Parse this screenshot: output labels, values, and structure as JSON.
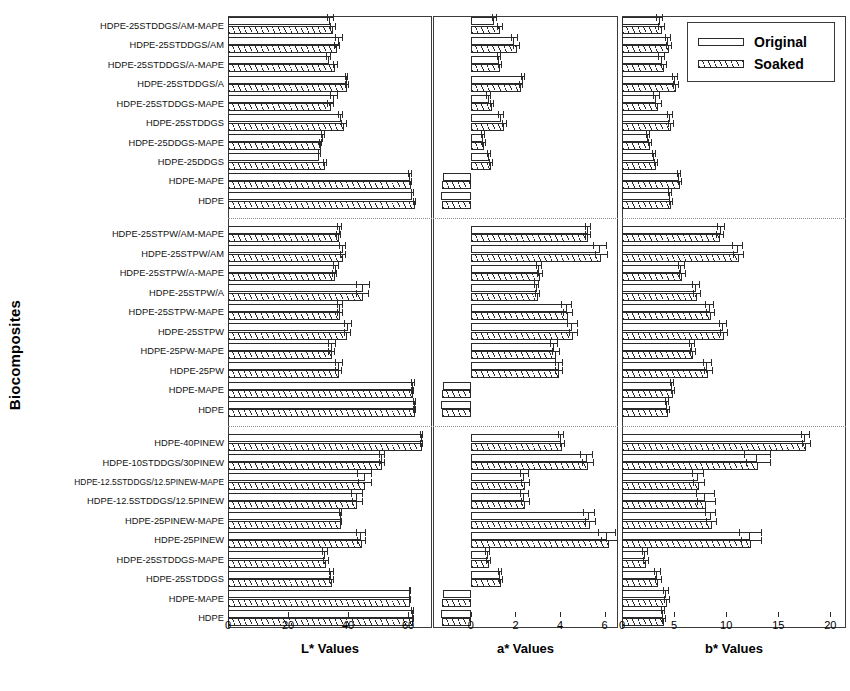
{
  "axis_titles": {
    "y": "Biocomposites",
    "l": "L* Values",
    "a": "a* Values",
    "b": "b* Values"
  },
  "legend": {
    "items": [
      {
        "label": "Original",
        "pattern": "solid-outline"
      },
      {
        "label": "Soaked",
        "pattern": "diagonal-hatch"
      }
    ]
  },
  "colors": {
    "line": "#2a2a2a",
    "frame": "#3b3b3b",
    "divider": "#8e8e8e",
    "fill": "#ffffff"
  },
  "ticks": {
    "l": [
      {
        "v": 0,
        "label": "0"
      },
      {
        "v": 20,
        "label": "20"
      },
      {
        "v": 40,
        "label": "40"
      },
      {
        "v": 60,
        "label": "60"
      }
    ],
    "a": [
      {
        "v": 0,
        "label": "0"
      },
      {
        "v": 2,
        "label": "2"
      },
      {
        "v": 4,
        "label": "4"
      },
      {
        "v": 6,
        "label": "6"
      }
    ],
    "b": [
      {
        "v": 0,
        "label": "0"
      },
      {
        "v": 5,
        "label": "5"
      },
      {
        "v": 10,
        "label": "10"
      },
      {
        "v": 15,
        "label": "15"
      },
      {
        "v": 20,
        "label": "20"
      }
    ]
  },
  "chart_data": {
    "type": "bar",
    "orientation": "horizontal",
    "title": "",
    "ylabel": "Biocomposites",
    "grid": false,
    "legend_position": "top-right",
    "panels": [
      {
        "key": "l",
        "xlabel": "L* Values",
        "xlim": [
          0,
          68
        ],
        "axis_min": 0
      },
      {
        "key": "a",
        "xlabel": "a* Values",
        "xlim": [
          -1.7,
          6.6
        ],
        "axis_min": -1.7
      },
      {
        "key": "b",
        "xlabel": "b* Values",
        "xlim": [
          0,
          21.5
        ],
        "axis_min": 0
      }
    ],
    "series": [
      "Original",
      "Soaked"
    ],
    "groups": [
      {
        "name": "DDGS group",
        "categories": [
          "HDPE-25STDDGS/AM-MAPE",
          "HDPE-25STDDGS/AM",
          "HDPE-25STDDGS/A-MAPE",
          "HDPE-25STDDGS/A",
          "HDPE-25STDDGS-MAPE",
          "HDPE-25STDDGS",
          "HDPE-25DDGS-MAPE",
          "HDPE-25DDGS",
          "HDPE-MAPE",
          "HDPE"
        ],
        "l": {
          "Original": [
            34.1,
            37.0,
            33.5,
            39.6,
            35.3,
            37.5,
            31.6,
            30.4,
            60.6,
            61.4
          ],
          "Soaked": [
            35.0,
            36.3,
            35.8,
            39.7,
            34.2,
            38.7,
            30.9,
            32.3,
            60.9,
            62.3
          ],
          "err_original": [
            1.2,
            1.3,
            0.9,
            0.5,
            1.3,
            0.8,
            0.7,
            0.5,
            0.7,
            0.5
          ],
          "err_soaked": [
            1.0,
            1.1,
            0.8,
            0.6,
            1.1,
            0.9,
            0.6,
            0.6,
            0.6,
            0.5
          ]
        },
        "a": {
          "Original": [
            1.05,
            1.95,
            1.25,
            2.35,
            0.8,
            1.35,
            0.55,
            0.8,
            -1.25,
            -1.35
          ],
          "Soaked": [
            1.3,
            2.05,
            1.3,
            2.25,
            0.95,
            1.5,
            0.6,
            0.9,
            -1.3,
            -1.3
          ],
          "err_original": [
            0.12,
            0.15,
            0.1,
            0.1,
            0.1,
            0.12,
            0.08,
            0.08,
            0.08,
            0.08
          ],
          "err_soaked": [
            0.12,
            0.14,
            0.1,
            0.1,
            0.1,
            0.12,
            0.08,
            0.08,
            0.08,
            0.08
          ]
        },
        "b": {
          "Original": [
            3.6,
            4.4,
            3.8,
            5.1,
            3.3,
            4.6,
            2.5,
            3.1,
            5.5,
            4.6
          ],
          "Soaked": [
            3.8,
            4.5,
            4.0,
            5.2,
            3.5,
            4.7,
            2.7,
            3.3,
            5.6,
            4.7
          ],
          "err_original": [
            0.3,
            0.3,
            0.3,
            0.3,
            0.3,
            0.3,
            0.2,
            0.2,
            0.2,
            0.2
          ],
          "err_soaked": [
            0.3,
            0.3,
            0.3,
            0.3,
            0.3,
            0.3,
            0.2,
            0.2,
            0.2,
            0.2
          ]
        }
      },
      {
        "name": "PW / STPW group",
        "categories": [
          "HDPE-25STPW/AM-MAPE",
          "HDPE-25STPW/AM",
          "HDPE-25STPW/A-MAPE",
          "HDPE-25STPW/A",
          "HDPE-25STPW-MAPE",
          "HDPE-25STPW",
          "HDPE-25PW-MAPE",
          "HDPE-25PW",
          "HDPE-MAPE",
          "HDPE"
        ],
        "l": {
          "Original": [
            37.2,
            38.3,
            36.0,
            45.0,
            37.3,
            39.9,
            34.7,
            37.0,
            61.6,
            62.3
          ],
          "Soaked": [
            36.9,
            38.4,
            35.6,
            44.9,
            37.2,
            39.8,
            34.5,
            36.9,
            61.5,
            62.2
          ],
          "err_original": [
            0.8,
            1.2,
            0.9,
            2.4,
            1.0,
            1.4,
            1.3,
            1.2,
            0.6,
            0.5
          ],
          "err_soaked": [
            0.8,
            1.1,
            0.8,
            2.2,
            1.0,
            1.3,
            1.2,
            1.1,
            0.6,
            0.5
          ]
        },
        "a": {
          "Original": [
            5.25,
            5.8,
            3.05,
            2.95,
            4.3,
            4.55,
            3.75,
            3.95,
            -1.25,
            -1.35
          ],
          "Soaked": [
            5.25,
            5.85,
            3.1,
            3.0,
            4.35,
            4.6,
            3.8,
            3.95,
            -1.3,
            -1.3
          ],
          "err_original": [
            0.12,
            0.3,
            0.15,
            0.12,
            0.25,
            0.25,
            0.18,
            0.18,
            0.08,
            0.08
          ],
          "err_soaked": [
            0.12,
            0.28,
            0.15,
            0.12,
            0.22,
            0.22,
            0.18,
            0.18,
            0.08,
            0.08
          ]
        },
        "b": {
          "Original": [
            9.5,
            11.1,
            5.7,
            7.1,
            8.4,
            9.7,
            6.7,
            8.2,
            4.8,
            4.3
          ],
          "Soaked": [
            9.4,
            11.2,
            5.8,
            7.2,
            8.5,
            9.8,
            6.8,
            8.3,
            4.9,
            4.4
          ],
          "err_original": [
            0.4,
            0.5,
            0.3,
            0.4,
            0.4,
            0.4,
            0.3,
            0.4,
            0.2,
            0.2
          ],
          "err_soaked": [
            0.4,
            0.5,
            0.3,
            0.4,
            0.4,
            0.4,
            0.3,
            0.4,
            0.2,
            0.2
          ]
        }
      },
      {
        "name": "PINEW group",
        "categories": [
          "HDPE-40PINEW",
          "HDPE-10STDDGS/30PINEW",
          "HDPE-12.5STDDGS/12.5PINEW-MAPE",
          "HDPE-12.5STDDGS/12.5PINEW",
          "HDPE-25PINEW-MAPE",
          "HDPE-25PINEW",
          "HDPE-25STDDGS-MAPE",
          "HDPE-25STDDGS",
          "HDPE-MAPE",
          "HDPE"
        ],
        "l": {
          "Original": [
            64.5,
            51.2,
            45.5,
            43.0,
            37.5,
            44.3,
            32.4,
            34.4,
            60.6,
            61.5
          ],
          "Soaked": [
            64.6,
            51.3,
            45.6,
            43.1,
            37.6,
            44.5,
            32.5,
            34.6,
            60.7,
            61.6
          ],
          "err_original": [
            0.5,
            1.0,
            2.5,
            2.0,
            0.4,
            1.6,
            1.0,
            0.8,
            0.4,
            0.4
          ],
          "err_soaked": [
            0.5,
            1.0,
            2.4,
            1.9,
            0.4,
            1.5,
            1.0,
            0.8,
            0.4,
            0.4
          ]
        },
        "a": {
          "Original": [
            4.05,
            5.2,
            2.4,
            2.4,
            5.3,
            6.1,
            0.75,
            1.3,
            -1.25,
            -1.35
          ],
          "Soaked": [
            4.1,
            5.25,
            2.45,
            2.45,
            5.35,
            6.2,
            0.8,
            1.35,
            -1.3,
            -1.3
          ],
          "err_original": [
            0.12,
            0.3,
            0.2,
            0.2,
            0.25,
            0.4,
            0.1,
            0.1,
            0.08,
            0.08
          ],
          "err_soaked": [
            0.12,
            0.28,
            0.2,
            0.2,
            0.25,
            0.38,
            0.1,
            0.1,
            0.08,
            0.08
          ]
        },
        "b": {
          "Original": [
            17.6,
            13.0,
            7.3,
            8.0,
            8.5,
            12.3,
            2.2,
            3.4,
            4.2,
            3.9
          ],
          "Soaked": [
            17.7,
            13.1,
            7.4,
            8.1,
            8.6,
            12.4,
            2.3,
            3.5,
            4.3,
            4.0
          ],
          "err_original": [
            0.4,
            1.3,
            0.6,
            0.9,
            0.5,
            1.1,
            0.3,
            0.3,
            0.3,
            0.2
          ],
          "err_soaked": [
            0.4,
            1.2,
            0.6,
            0.9,
            0.5,
            1.0,
            0.3,
            0.3,
            0.3,
            0.2
          ]
        }
      }
    ]
  }
}
